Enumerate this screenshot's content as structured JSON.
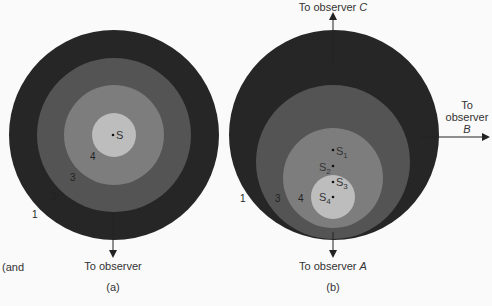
{
  "panel_a": {
    "caption": "(a)",
    "source_label": "S",
    "observer_label": "To observer",
    "ring_numbers": [
      "1",
      "2",
      "3",
      "4"
    ],
    "side_text": "(and"
  },
  "panel_b": {
    "caption": "(b)",
    "source_labels": [
      "S",
      "S",
      "S",
      "S"
    ],
    "source_subscripts": [
      "1",
      "2",
      "3",
      "4"
    ],
    "observer_a": {
      "prefix": "To observer ",
      "letter": "A"
    },
    "observer_b": {
      "line1": "To",
      "line2": "observer",
      "letter": "B"
    },
    "observer_c": {
      "prefix": "To observer ",
      "letter": "C"
    },
    "ring_numbers": [
      "1",
      "3",
      "4"
    ]
  },
  "colors": {
    "ring1": "#262626",
    "ring2": "#545454",
    "ring3": "#7d7d7d",
    "ring4": "#bdbdbd",
    "background": "#fafafa"
  }
}
